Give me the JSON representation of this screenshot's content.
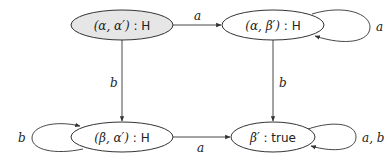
{
  "diagram": {
    "type": "state-machine",
    "nodes": [
      {
        "id": "n1",
        "label_math": "(α, α′)",
        "label_sep": " : ",
        "label_val": "H",
        "fill": "#e6e6e6",
        "initial": true
      },
      {
        "id": "n2",
        "label_math": "(α, β′)",
        "label_sep": " : ",
        "label_val": "H",
        "fill": "#ffffff"
      },
      {
        "id": "n3",
        "label_math": "(β, α′)",
        "label_sep": " : ",
        "label_val": "H",
        "fill": "#ffffff"
      },
      {
        "id": "n4",
        "label_math": "β′",
        "label_sep": " : ",
        "label_val": "true",
        "fill": "#ffffff"
      }
    ],
    "edges": [
      {
        "from": "n1",
        "to": "n2",
        "label": "a"
      },
      {
        "from": "n2",
        "to": "n2",
        "label": "a"
      },
      {
        "from": "n1",
        "to": "n3",
        "label": "b"
      },
      {
        "from": "n2",
        "to": "n4",
        "label": "b"
      },
      {
        "from": "n3",
        "to": "n3",
        "label": "b"
      },
      {
        "from": "n3",
        "to": "n4",
        "label": "a"
      },
      {
        "from": "n4",
        "to": "n4",
        "label": "a, b"
      }
    ]
  }
}
